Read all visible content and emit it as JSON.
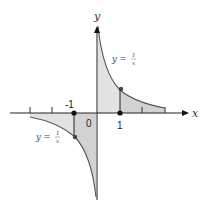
{
  "diagram": {
    "axes": {
      "x_label": "x",
      "y_label": "y",
      "origin_label": "0",
      "tick_labels": [
        "-1",
        "1"
      ]
    },
    "curves": [
      {
        "name": "right-branch",
        "equation_lhs": "y =",
        "numerator": "1",
        "denominator": "x",
        "domain": "x > 0"
      },
      {
        "name": "left-branch",
        "equation_lhs": "y =",
        "numerator": "1",
        "denominator": "x",
        "domain": "x < 0"
      }
    ],
    "points": [
      {
        "label": "1",
        "x": 1,
        "y": 0
      },
      {
        "label": "-1",
        "x": -1,
        "y": 0
      },
      {
        "label": "(1,1)",
        "x": 1,
        "y": 1
      },
      {
        "label": "(-1,-1)",
        "x": -1,
        "y": -1
      }
    ],
    "colors": {
      "shade_light": "#e0e0e0",
      "shade_dark": "#cccccc",
      "curve": "#555555",
      "axis": "#222222",
      "dot": "#111111"
    }
  }
}
